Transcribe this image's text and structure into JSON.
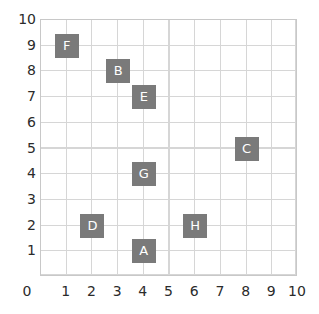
{
  "chart_data": {
    "type": "scatter",
    "title": "",
    "xlabel": "",
    "ylabel": "",
    "xlim": [
      0,
      10
    ],
    "ylim": [
      0,
      10
    ],
    "grid": true,
    "legend": false,
    "marker_style": "square-labeled",
    "colors": {
      "marker_fill": "#7a7a7a",
      "marker_label": "#ffffff",
      "grid_line": "#d6d6d6",
      "plot_border": "#c8c8c8",
      "tick_label": "#2b2b2b",
      "background": "#ffffff"
    },
    "xticks": [
      "0",
      "1",
      "2",
      "3",
      "4",
      "5",
      "6",
      "7",
      "8",
      "9",
      "10"
    ],
    "yticks": [
      "0",
      "1",
      "2",
      "3",
      "4",
      "5",
      "6",
      "7",
      "8",
      "9",
      "10"
    ],
    "points": [
      {
        "label": "A",
        "x": 4,
        "y": 1
      },
      {
        "label": "B",
        "x": 3,
        "y": 8
      },
      {
        "label": "C",
        "x": 8,
        "y": 5
      },
      {
        "label": "D",
        "x": 2,
        "y": 2
      },
      {
        "label": "E",
        "x": 4,
        "y": 7
      },
      {
        "label": "F",
        "x": 1,
        "y": 9
      },
      {
        "label": "G",
        "x": 4,
        "y": 4
      },
      {
        "label": "H",
        "x": 6,
        "y": 2
      }
    ]
  },
  "axes": {
    "origin_label": "0",
    "x_tick_labels": [
      "1",
      "2",
      "3",
      "4",
      "5",
      "6",
      "7",
      "8",
      "9",
      "10"
    ],
    "y_tick_labels": [
      "10",
      "9",
      "8",
      "7",
      "6",
      "5",
      "4",
      "3",
      "2",
      "1"
    ]
  }
}
